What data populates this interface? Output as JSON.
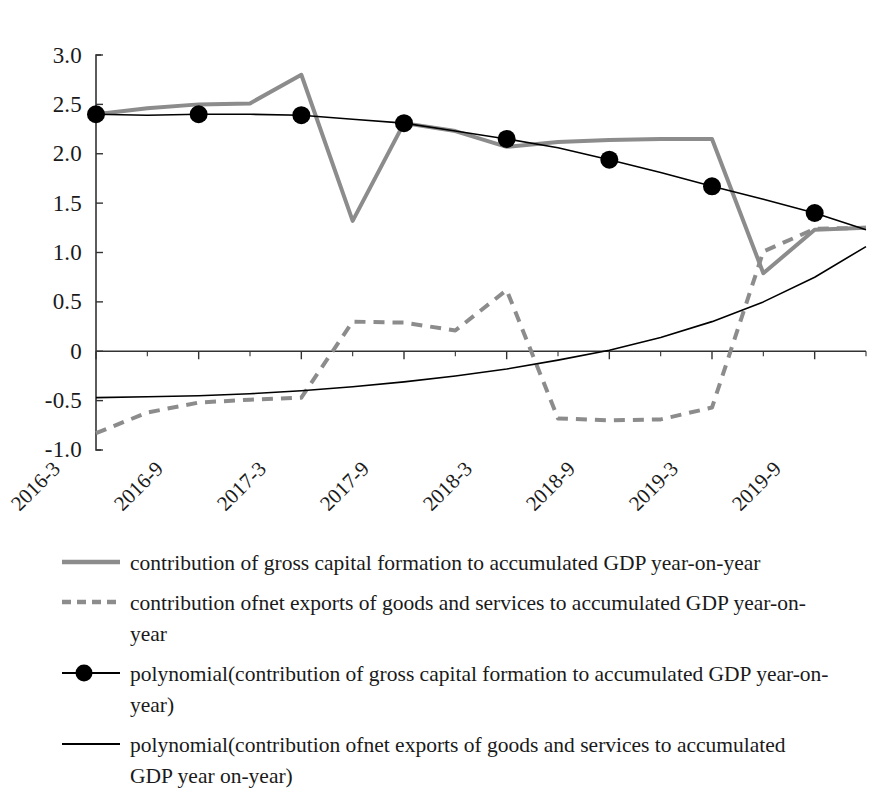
{
  "chart_data": {
    "type": "line",
    "title": "",
    "subtitle": "",
    "xlabel": "",
    "ylabel": "",
    "grid": false,
    "legend_position": "bottom-left",
    "ylim": [
      -1.0,
      3.0
    ],
    "yticks": [
      "3.0",
      "2.5",
      "2.0",
      "1.5",
      "1.0",
      "0.5",
      "0",
      "-0.5",
      "-1.0"
    ],
    "ytick_values": [
      3.0,
      2.5,
      2.0,
      1.5,
      1.0,
      0.5,
      0,
      -0.5,
      -1.0
    ],
    "xticks": [
      "2016-3",
      "2016-9",
      "2017-3",
      "2017-9",
      "2018-3",
      "2018-9",
      "2019-3",
      "2019-9"
    ],
    "x": [
      "2016-3",
      "2016-6",
      "2016-9",
      "2016-12",
      "2017-3",
      "2017-6",
      "2017-9",
      "2017-12",
      "2018-3",
      "2018-6",
      "2018-9",
      "2018-12",
      "2019-3",
      "2019-6",
      "2019-9",
      "2019-12"
    ],
    "zero_line": 0,
    "series": [
      {
        "name": "contribution of gross capital formation to accumulated GDP year-on-year",
        "style": "solid",
        "color": "#8c8c8c",
        "width": 4,
        "marker": "none",
        "values": [
          2.4,
          2.46,
          2.5,
          2.51,
          2.8,
          1.32,
          2.31,
          2.23,
          2.07,
          2.12,
          2.14,
          2.15,
          2.15,
          0.79,
          1.23,
          1.25
        ]
      },
      {
        "name": "contribution ofnet exports of goods and services to accumulated GDP year-on-year",
        "style": "dashed",
        "color": "#8c8c8c",
        "width": 4,
        "marker": "none",
        "values": [
          -0.83,
          -0.62,
          -0.52,
          -0.49,
          -0.47,
          0.3,
          0.29,
          0.21,
          0.62,
          -0.68,
          -0.7,
          -0.69,
          -0.57,
          1.01,
          1.24,
          1.25
        ]
      },
      {
        "name": "polynomial(contribution of gross capital formation to accumulated GDP year-on-year)",
        "style": "solid",
        "color": "#000000",
        "width": 1.6,
        "marker": "circle",
        "values": [
          2.4,
          2.39,
          2.4,
          2.4,
          2.39,
          2.35,
          2.31,
          2.23,
          2.15,
          2.06,
          1.94,
          1.81,
          1.67,
          1.54,
          1.4,
          1.23
        ]
      },
      {
        "name": "polynomial(contribution ofnet exports of goods and services to accumulated GDP year-on-year)",
        "style": "solid",
        "color": "#000000",
        "width": 1.6,
        "marker": "none",
        "values": [
          -0.47,
          -0.46,
          -0.45,
          -0.43,
          -0.4,
          -0.36,
          -0.31,
          -0.25,
          -0.18,
          -0.09,
          0.01,
          0.14,
          0.3,
          0.5,
          0.75,
          1.06
        ]
      }
    ]
  },
  "yaxis": {
    "t0": "3.0",
    "t1": "2.5",
    "t2": "2.0",
    "t3": "1.5",
    "t4": "1.0",
    "t5": "0.5",
    "t6": "0",
    "t7": "-0.5",
    "t8": "-1.0"
  },
  "xaxis": {
    "t0": "2016-3",
    "t1": "2016-9",
    "t2": "2017-3",
    "t3": "2017-9",
    "t4": "2018-3",
    "t5": "2018-9",
    "t6": "2019-3",
    "t7": "2019-9"
  },
  "legend": {
    "item0": "contribution of gross capital formation to accumulated GDP year-on-year",
    "item1": "contribution ofnet exports of goods and services to accumulated GDP year-on-year",
    "item2": "polynomial(contribution of gross capital formation to accumulated GDP year-on-year)",
    "item3": "polynomial(contribution ofnet exports of goods and services to accumulated GDP year on-year)"
  },
  "colors": {
    "gray_series": "#8c8c8c",
    "black_series": "#000000",
    "axis": "#333333",
    "background": "#ffffff"
  }
}
